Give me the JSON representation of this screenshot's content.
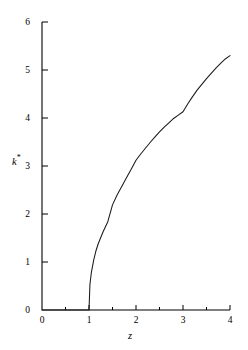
{
  "chart_data": {
    "type": "line",
    "title": "",
    "subtitle": "",
    "xlabel": "z",
    "ylabel": "k*",
    "xlim": [
      0,
      4
    ],
    "ylim": [
      0,
      6
    ],
    "grid": false,
    "legend": null,
    "xticks": [
      "0",
      "1",
      "2",
      "3",
      "4"
    ],
    "xtick_values": [
      0,
      1,
      2,
      3,
      4
    ],
    "xminor_values": [
      0.5,
      1.5,
      2.5,
      3.5
    ],
    "yticks": [
      "0",
      "1",
      "2",
      "3",
      "4",
      "5",
      "6"
    ],
    "ytick_values": [
      0,
      1,
      2,
      3,
      4,
      5,
      6
    ],
    "line_color": "#1a1a1a",
    "axis_color": "#000000",
    "series": [
      {
        "name": "k*",
        "x": [
          0.0,
          0.1,
          0.2,
          0.3,
          0.4,
          0.5,
          0.6,
          0.7,
          0.8,
          0.9,
          1.0,
          1.02,
          1.05,
          1.1,
          1.15,
          1.2,
          1.3,
          1.4,
          1.5,
          1.6,
          1.7,
          1.8,
          1.9,
          2.0,
          2.1,
          2.2,
          2.3,
          2.4,
          2.5,
          2.6,
          2.7,
          2.8,
          2.9,
          3.0,
          3.1,
          3.2,
          3.3,
          3.4,
          3.5,
          3.6,
          3.7,
          3.8,
          3.9,
          4.0
        ],
        "y": [
          0.0,
          0.0,
          0.0,
          0.0,
          0.0,
          0.0,
          0.0,
          0.0,
          0.0,
          0.0,
          0.0,
          0.53,
          0.78,
          1.04,
          1.24,
          1.39,
          1.63,
          1.84,
          2.19,
          2.4,
          2.58,
          2.76,
          2.94,
          3.12,
          3.25,
          3.37,
          3.49,
          3.6,
          3.71,
          3.81,
          3.9,
          3.99,
          4.06,
          4.13,
          4.29,
          4.44,
          4.58,
          4.7,
          4.82,
          4.93,
          5.04,
          5.14,
          5.23,
          5.3
        ]
      }
    ],
    "annotations": []
  },
  "axes": {
    "x_title": "z",
    "y_title_base": "k",
    "y_title_sup": "*"
  }
}
